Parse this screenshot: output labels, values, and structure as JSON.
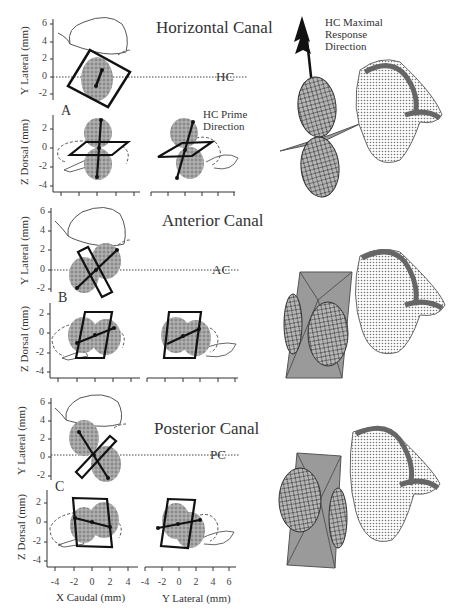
{
  "figure": {
    "panels": [
      {
        "label": "A",
        "title": "Horizontal Canal",
        "canal_abbrev": "HC",
        "annotation": [
          "HC  Prime",
          "Direction"
        ],
        "right_annotation": [
          "HC  Maximal",
          "Response",
          "Direction"
        ]
      },
      {
        "label": "B",
        "title": "Anterior Canal",
        "canal_abbrev": "AC"
      },
      {
        "label": "C",
        "title": "Posterior Canal",
        "canal_abbrev": "PC"
      }
    ],
    "axes": {
      "y_lateral_label": "Y Lateral (mm)",
      "z_dorsal_label": "Z Dorsal (mm)",
      "x_caudal_label": "X Caudal (mm)",
      "y_lateral_bottom_label": "Y Lateral (mm)",
      "y_lateral_ticks": [
        "6",
        "4",
        "2",
        "0",
        "-2"
      ],
      "z_dorsal_ticks": [
        "2",
        "0",
        "-2",
        "-4"
      ],
      "x_caudal_ticks": [
        "-4",
        "-2",
        "0",
        "2",
        "4"
      ],
      "y_lateral_bottom_ticks": [
        "-4",
        "-2",
        "0",
        "2",
        "4",
        "6"
      ]
    }
  }
}
